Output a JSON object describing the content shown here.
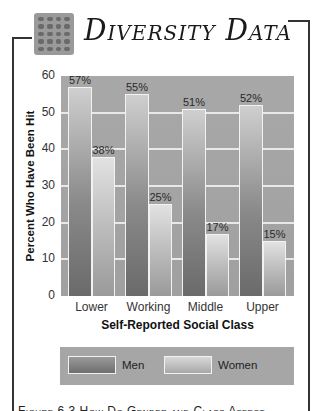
{
  "header": {
    "title": "Diversity Data",
    "logo_icon": "brick-pattern-icon"
  },
  "chart_data": {
    "type": "bar",
    "title": "Diversity Data",
    "xlabel": "Self-Reported Social Class",
    "ylabel": "Percent Who Have Been Hit",
    "categories": [
      "Lower",
      "Working",
      "Middle",
      "Upper"
    ],
    "series": [
      {
        "name": "Men",
        "values": [
          57,
          55,
          51,
          52
        ],
        "labels": [
          "57%",
          "55%",
          "51%",
          "52%"
        ],
        "color": "#7a7a7a"
      },
      {
        "name": "Women",
        "values": [
          38,
          25,
          17,
          15
        ],
        "labels": [
          "38%",
          "25%",
          "17%",
          "15%"
        ],
        "color": "#c4c4c4"
      }
    ],
    "ylim": [
      0,
      60
    ],
    "yticks": [
      "0",
      "10",
      "20",
      "30",
      "40",
      "50",
      "60"
    ],
    "grid": true,
    "legend_position": "bottom"
  },
  "legend": {
    "items": [
      {
        "label": "Men"
      },
      {
        "label": "Women"
      }
    ]
  },
  "caption": "Figure 6.3   How Do Gender and Class Affect"
}
